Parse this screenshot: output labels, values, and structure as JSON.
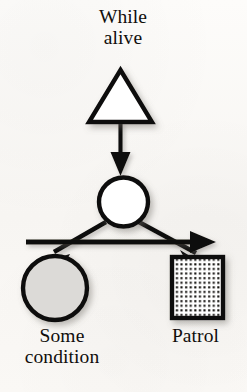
{
  "diagram": {
    "type": "activity-fork-diagram",
    "background_color": "#fbfaf8",
    "stroke_color": "#100e0c",
    "title": "While\nalive",
    "nodes": [
      {
        "id": "start-triangle",
        "shape": "triangle",
        "fill": "#ffffff",
        "stroke": "#100e0c",
        "label": "While\nalive",
        "label_position": "above"
      },
      {
        "id": "decision-circle",
        "shape": "circle",
        "fill": "#ffffff",
        "stroke": "#100e0c",
        "label": ""
      },
      {
        "id": "some-condition-circle",
        "shape": "circle",
        "fill": "#dcdad7",
        "stroke": "#100e0c",
        "label": "Some\ncondition",
        "label_position": "below"
      },
      {
        "id": "patrol-square",
        "shape": "square",
        "fill": "dotted-pattern",
        "stroke": "#100e0c",
        "label": "Patrol",
        "label_position": "below"
      }
    ],
    "edges": [
      {
        "id": "edge-triangle-to-circle",
        "from": "start-triangle",
        "to": "decision-circle",
        "style": "solid",
        "arrowhead": "filled"
      },
      {
        "id": "edge-fork-bar",
        "from": "decision-circle",
        "to": "fork-bar-end",
        "style": "solid-bar",
        "arrowhead": "filled"
      },
      {
        "id": "edge-circle-to-condition",
        "from": "decision-circle",
        "to": "some-condition-circle",
        "style": "solid",
        "arrowhead": "filled"
      },
      {
        "id": "edge-circle-to-patrol",
        "from": "decision-circle",
        "to": "patrol-square",
        "style": "solid",
        "arrowhead": "filled"
      }
    ]
  },
  "labels": {
    "title_line1": "While",
    "title_line2": "alive",
    "left_node_line1": "Some",
    "left_node_line2": "condition",
    "right_node": "Patrol"
  }
}
